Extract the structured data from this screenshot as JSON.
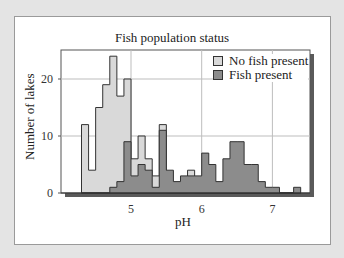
{
  "chart_data": {
    "type": "bar",
    "title": "Fish population status",
    "xlabel": "pH",
    "ylabel": "Number of lakes",
    "xlim": [
      4.1,
      7.6
    ],
    "ylim": [
      0,
      25
    ],
    "xticks": [
      5,
      6,
      7
    ],
    "yticks": [
      0,
      10,
      20
    ],
    "grid": true,
    "legend_position": "upper right",
    "bin_width": 0.1,
    "bin_start": 4.3,
    "categories": [
      "4.3",
      "4.4",
      "4.5",
      "4.6",
      "4.7",
      "4.8",
      "4.9",
      "5.0",
      "5.1",
      "5.2",
      "5.3",
      "5.4",
      "5.5",
      "5.6",
      "5.7",
      "5.8",
      "5.9",
      "6.0",
      "6.1",
      "6.2",
      "6.3",
      "6.4",
      "6.5",
      "6.6",
      "6.7",
      "6.8",
      "6.9",
      "7.0",
      "7.1",
      "7.2",
      "7.3"
    ],
    "series": [
      {
        "name": "No fish present",
        "color": "#d9d9d9",
        "values": [
          12,
          4,
          15,
          19,
          24,
          17,
          20,
          6,
          10,
          6,
          3,
          12,
          0,
          0,
          0,
          4,
          0,
          0,
          0,
          0,
          0,
          0,
          0,
          0,
          0,
          0,
          0,
          0,
          0,
          0,
          0
        ]
      },
      {
        "name": "Fish present",
        "color": "#8c8c8c",
        "values": [
          0,
          0,
          0,
          0,
          1,
          2,
          9,
          3,
          5,
          4,
          1,
          11,
          4,
          2,
          3,
          3,
          3,
          7,
          5,
          2,
          6,
          9,
          9,
          5,
          5,
          2,
          1,
          1,
          0,
          0,
          1
        ]
      }
    ]
  },
  "title": "Fish population status",
  "axes": {
    "xlabel": "pH",
    "ylabel": "Number of lakes",
    "xticks": [
      "5",
      "6",
      "7"
    ],
    "yticks": [
      "0",
      "10",
      "20"
    ]
  },
  "legend": {
    "items": [
      {
        "label": "No fish present",
        "color": "#d9d9d9"
      },
      {
        "label": "Fish present",
        "color": "#8c8c8c"
      }
    ]
  }
}
